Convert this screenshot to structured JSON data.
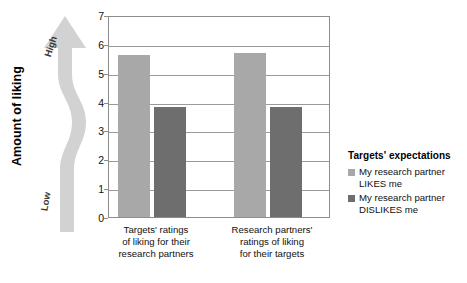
{
  "axis_title": "Amount of liking",
  "arrow": {
    "high_label": "High",
    "low_label": "Low",
    "color": "#d2d2d2",
    "icon": "up-arrow-icon"
  },
  "legend": {
    "title": "Targets' expectations",
    "entries": [
      {
        "label": "My research partner LIKES me",
        "color": "#a8a8a8"
      },
      {
        "label": "My research partner DISLIKES me",
        "color": "#6e6e6e"
      }
    ]
  },
  "chart_data": {
    "type": "bar",
    "title": "",
    "subtitle": "",
    "xlabel": "",
    "ylabel": "Amount of liking",
    "ylim": [
      0,
      7
    ],
    "yticks": [
      0,
      1,
      2,
      3,
      4,
      5,
      6,
      7
    ],
    "ytick_labels": [
      "0",
      "1",
      "2",
      "3",
      "4",
      "5",
      "6",
      "7"
    ],
    "grid": true,
    "legend_position": "right",
    "categories": [
      "Targets' ratings of liking for their research partners",
      "Research partners' ratings of liking for their targets"
    ],
    "category_label_lines": [
      [
        "Targets' ratings",
        "of liking for their",
        "research partners"
      ],
      [
        "Research partners'",
        "ratings of liking",
        "for their targets"
      ]
    ],
    "series": [
      {
        "name": "My research partner LIKES me",
        "color": "#a8a8a8",
        "values": [
          5.6,
          5.7
        ]
      },
      {
        "name": "My research partner DISLIKES me",
        "color": "#6e6e6e",
        "values": [
          3.8,
          3.8
        ]
      }
    ]
  }
}
